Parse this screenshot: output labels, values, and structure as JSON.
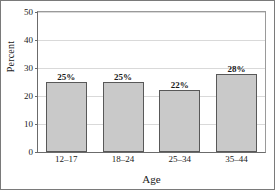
{
  "chart_data": {
    "type": "bar",
    "title": "",
    "xlabel": "Age",
    "ylabel": "Percent",
    "categories": [
      "12–17",
      "18–24",
      "25–34",
      "35–44"
    ],
    "values": [
      25,
      25,
      22,
      28
    ],
    "data_labels": [
      "25%",
      "25%",
      "22%",
      "28%"
    ],
    "ylim": [
      0,
      50
    ],
    "yticks": [
      0,
      10,
      20,
      30,
      40,
      50
    ],
    "ytick_labels": [
      "0",
      "10",
      "20",
      "30",
      "40",
      "50"
    ],
    "grid": "horizontal",
    "legend": "none",
    "colors": {
      "bar_fill": "#c9c9c9",
      "bar_edge": "#585858",
      "gridline": "#d9d9d9",
      "axis": "#6b6b6b",
      "text": "#1a1a1a",
      "background": "#ffffff"
    }
  }
}
